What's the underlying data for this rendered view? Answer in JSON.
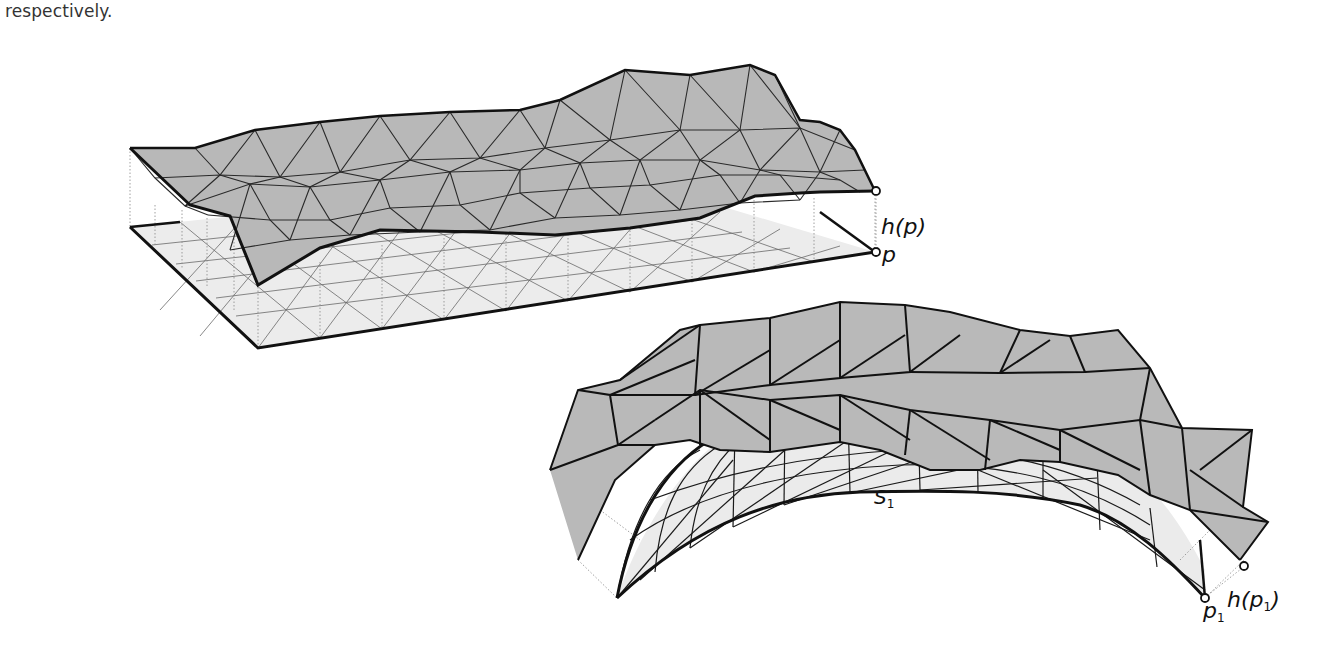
{
  "document": {
    "caption_fragment": "respectively."
  },
  "figure": {
    "panels": [
      {
        "name": "planar-heightfield",
        "base_surface_fill": "#ebebeb",
        "lifted_surface_fill": "#b9b9b9",
        "labels": {
          "lifted_point": "h(p)",
          "base_point": "p"
        }
      },
      {
        "name": "curved-heightfield",
        "base_surface_fill": "#ebebeb",
        "lifted_surface_fill": "#b9b9b9",
        "labels": {
          "surface": "S",
          "surface_sub": "1",
          "lifted_point_prefix": "h(p",
          "lifted_point_sub": "1",
          "lifted_point_suffix": ")",
          "base_point": "p",
          "base_point_sub": "1"
        }
      }
    ]
  }
}
